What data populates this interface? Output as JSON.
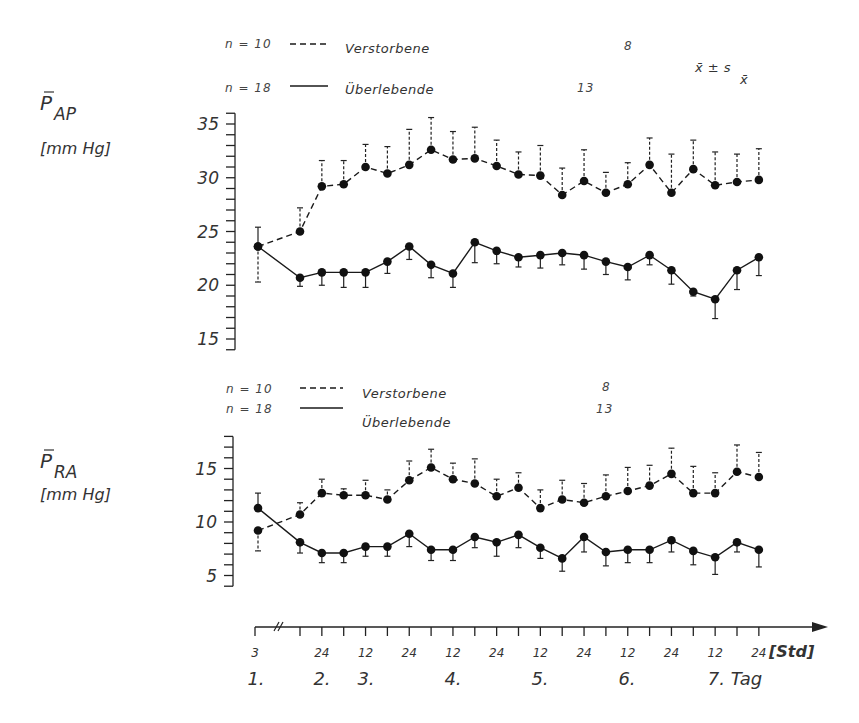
{
  "figure": {
    "stat_label": "x̄ ± s",
    "stat_sub": "x̄",
    "x_unit": "[Std]",
    "day_suffix": "Tag"
  },
  "legend": {
    "deceased": {
      "n_label": "n = 10",
      "name": "Verstorbene",
      "end_n": "8",
      "style": "dashed"
    },
    "survivors": {
      "n_label": "n = 18",
      "name": "Überlebende",
      "end_n": "13",
      "style": "solid"
    }
  },
  "panels": {
    "pap": {
      "ylabel_main": "P",
      "ylabel_sub": "AP",
      "ylabel_unit": "[mm Hg]"
    },
    "pra": {
      "ylabel_main": "P",
      "ylabel_sub": "RA",
      "ylabel_unit": "[mm Hg]"
    }
  },
  "x_axis": {
    "hour_labels": [
      "3",
      "24",
      "12",
      "24",
      "12",
      "24",
      "12",
      "24",
      "12",
      "24",
      "12",
      "24"
    ],
    "day_labels": [
      "1.",
      "2.",
      "3.",
      "4.",
      "5.",
      "6.",
      "7. Tag"
    ]
  },
  "chart_data": [
    {
      "type": "line",
      "title": "Mittlerer pulmonalarterieller Druck",
      "ylabel": "P̄AP [mm Hg]",
      "xlabel": "[Std]",
      "ylim": [
        14,
        36
      ],
      "yticks": [
        15,
        20,
        25,
        30,
        35
      ],
      "x": [
        3,
        12,
        24,
        36,
        48,
        60,
        72,
        84,
        96,
        108,
        120,
        132,
        144,
        156,
        168,
        180,
        192,
        204,
        216,
        228,
        240,
        252,
        264
      ],
      "error": "x̄ ± s_x̄",
      "series": [
        {
          "name": "Verstorbene (n = 10 → 8)",
          "style": "dashed",
          "values": [
            23.6,
            25.0,
            29.2,
            29.4,
            31.0,
            30.4,
            31.2,
            32.6,
            31.7,
            31.8,
            31.1,
            30.3,
            30.2,
            28.4,
            29.7,
            28.6,
            29.4,
            31.2,
            28.6,
            30.8,
            29.3,
            29.6,
            29.8
          ],
          "err_top": [
            20.3,
            27.2,
            31.6,
            31.6,
            33.1,
            32.9,
            34.5,
            35.6,
            34.3,
            34.7,
            33.5,
            32.4,
            33.0,
            30.9,
            32.6,
            30.5,
            31.4,
            33.7,
            32.2,
            33.5,
            32.4,
            32.2,
            32.7
          ]
        },
        {
          "name": "Überlebende (n = 18 → 13)",
          "style": "solid",
          "values": [
            23.6,
            20.7,
            21.2,
            21.2,
            21.2,
            22.2,
            23.6,
            21.9,
            21.1,
            24.0,
            23.2,
            22.6,
            22.8,
            23.0,
            22.8,
            22.2,
            21.7,
            22.8,
            21.4,
            19.4,
            18.7,
            21.4,
            22.6
          ],
          "err_bottom": [
            25.4,
            19.9,
            20.0,
            19.8,
            19.8,
            21.1,
            22.4,
            20.7,
            19.8,
            22.1,
            22.0,
            21.7,
            21.6,
            21.9,
            21.5,
            21.0,
            20.5,
            21.9,
            20.1,
            19.0,
            16.9,
            19.6,
            20.9
          ]
        }
      ]
    },
    {
      "type": "line",
      "title": "Mittlerer rechtsatrialer Druck",
      "ylabel": "P̄RA [mm Hg]",
      "xlabel": "[Std]",
      "ylim": [
        4,
        18
      ],
      "yticks": [
        5,
        10,
        15
      ],
      "x": [
        3,
        12,
        24,
        36,
        48,
        60,
        72,
        84,
        96,
        108,
        120,
        132,
        144,
        156,
        168,
        180,
        192,
        204,
        216,
        228,
        240,
        252,
        264
      ],
      "error": "x̄ ± s_x̄",
      "series": [
        {
          "name": "Verstorbene (n = 10 → 8)",
          "style": "dashed",
          "values": [
            9.2,
            10.7,
            12.7,
            12.5,
            12.5,
            12.1,
            13.9,
            15.1,
            14.0,
            13.6,
            12.4,
            13.2,
            11.3,
            12.1,
            11.8,
            12.4,
            12.9,
            13.4,
            14.5,
            12.7,
            12.7,
            14.7,
            14.2
          ],
          "err_top": [
            7.3,
            11.8,
            14.0,
            13.1,
            13.9,
            13.0,
            15.7,
            16.8,
            15.5,
            15.9,
            14.0,
            14.6,
            13.0,
            13.9,
            13.6,
            14.4,
            15.1,
            15.3,
            16.9,
            15.2,
            14.6,
            17.2,
            16.5
          ]
        },
        {
          "name": "Überlebende (n = 18 → 13)",
          "style": "solid",
          "values": [
            11.3,
            8.1,
            7.1,
            7.1,
            7.7,
            7.7,
            8.9,
            7.4,
            7.4,
            8.6,
            8.1,
            8.8,
            7.6,
            6.6,
            8.6,
            7.2,
            7.4,
            7.4,
            8.3,
            7.3,
            6.7,
            8.1,
            7.4
          ],
          "err_bottom": [
            12.7,
            7.1,
            6.2,
            6.2,
            6.8,
            6.8,
            7.7,
            6.4,
            6.4,
            7.6,
            6.8,
            7.6,
            6.6,
            5.4,
            7.2,
            5.9,
            6.2,
            6.2,
            7.2,
            6.0,
            5.1,
            7.2,
            5.8
          ]
        }
      ]
    }
  ]
}
